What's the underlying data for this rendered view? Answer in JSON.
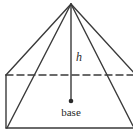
{
  "diagram": {
    "type": "pyramid",
    "labels": {
      "height": "h",
      "base": "base"
    },
    "colors": {
      "stroke": "#3a3a3a",
      "background": "#ffffff"
    }
  }
}
